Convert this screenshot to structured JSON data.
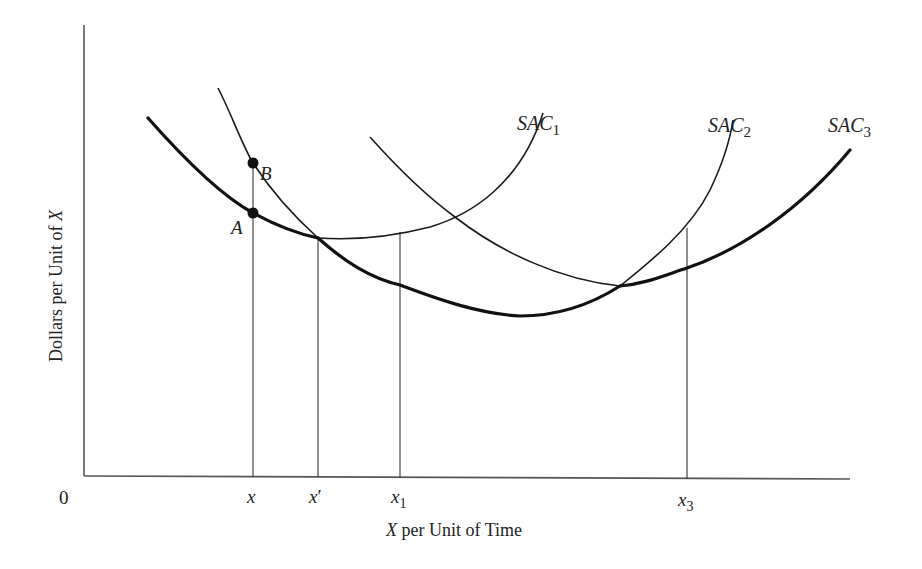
{
  "figure": {
    "origin_label": "0",
    "x_axis_label_var": "X",
    "x_axis_label_rest": " per Unit of Time",
    "y_axis_label_main": "Dollars per Unit of ",
    "y_axis_label_var": "X",
    "x_ticks": [
      {
        "base": "x",
        "sub": "",
        "prime": ""
      },
      {
        "base": "x",
        "sub": "",
        "prime": "′"
      },
      {
        "base": "x",
        "sub": "1",
        "prime": ""
      },
      {
        "base": "x",
        "sub": "3",
        "prime": ""
      }
    ],
    "curves": [
      {
        "base": "SAC",
        "sub": "1"
      },
      {
        "base": "SAC",
        "sub": "2"
      },
      {
        "base": "SAC",
        "sub": "3"
      }
    ],
    "points": [
      {
        "label": "A",
        "description": "point on SAC1 at output x"
      },
      {
        "label": "B",
        "description": "point on SAC2 at output x"
      }
    ],
    "envelope_note": "Thick line traces the lowest short-run average cost (long-run envelope)"
  }
}
